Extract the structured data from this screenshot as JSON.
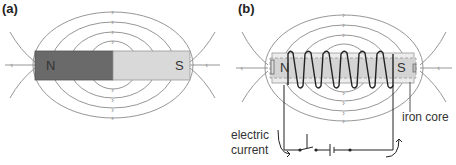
{
  "panel_a": {
    "label": "(a)",
    "north": "N",
    "south": "S"
  },
  "panel_b": {
    "label": "(b)",
    "north": "N",
    "south": "S",
    "iron_core_label": "iron core",
    "current_label_line1": "electric",
    "current_label_line2": "current"
  },
  "colors": {
    "north_pole": "#6a6a6a",
    "south_pole": "#d9d9d9",
    "field_lines": "#8a8a8a",
    "core": "#d4d4d4",
    "wire": "#222222"
  }
}
